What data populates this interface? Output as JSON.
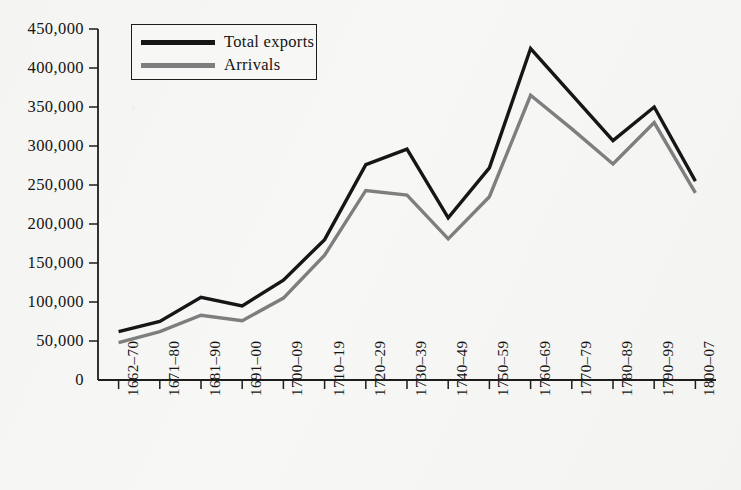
{
  "chart_data": {
    "type": "line",
    "title": "",
    "subtitle": "",
    "xlabel": "",
    "ylabel": "",
    "categories": [
      "1662–70",
      "1671–80",
      "1681–90",
      "1691–00",
      "1700–09",
      "1710–19",
      "1720–29",
      "1730–39",
      "1740–49",
      "1750–59",
      "1760–69",
      "1770–79",
      "1780–89",
      "1790–99",
      "1800–07"
    ],
    "series": [
      {
        "name": "Total exports",
        "color": "#161616",
        "values": [
          62000,
          75000,
          106000,
          95000,
          128000,
          180000,
          276000,
          296000,
          208000,
          272000,
          425000,
          366000,
          307000,
          350000,
          255000
        ]
      },
      {
        "name": "Arrivals",
        "color": "#7e7e7e",
        "values": [
          48000,
          62000,
          83000,
          76000,
          105000,
          160000,
          243000,
          237000,
          181000,
          235000,
          365000,
          322000,
          277000,
          330000,
          240000
        ]
      }
    ],
    "ylim": [
      0,
      450000
    ],
    "ytick_values": [
      0,
      50000,
      100000,
      150000,
      200000,
      250000,
      300000,
      350000,
      400000,
      450000
    ],
    "ytick_labels": [
      "0",
      "50,000",
      "100,000",
      "150,000",
      "200,000",
      "250,000",
      "300,000",
      "350,000",
      "400,000",
      "450,000"
    ],
    "grid": false,
    "legend_position": "top-left",
    "legend_entries": [
      "Total exports",
      "Arrivals"
    ]
  },
  "legend": {
    "items": [
      {
        "label": "Total exports",
        "color": "#161616"
      },
      {
        "label": "Arrivals",
        "color": "#7e7e7e"
      }
    ]
  },
  "colors": {
    "background": "#f7f7f5",
    "axis": "#1d1d1d",
    "total_exports": "#161616",
    "arrivals": "#7e7e7e"
  }
}
